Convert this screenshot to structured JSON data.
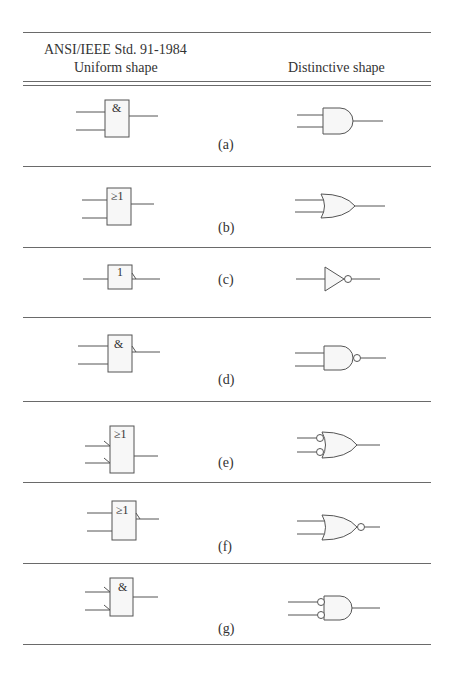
{
  "header": {
    "left_line1": "ANSI/IEEE Std. 91-1984",
    "left_line2": "Uniform shape",
    "right": "Distinctive shape"
  },
  "rows": [
    {
      "label": "(a)",
      "gate": "AND",
      "uniform_symbol": "&",
      "inputs": 2,
      "output_negated": false,
      "inputs_negated": false
    },
    {
      "label": "(b)",
      "gate": "OR",
      "uniform_symbol": "≥1",
      "inputs": 2,
      "output_negated": false,
      "inputs_negated": false
    },
    {
      "label": "(c)",
      "gate": "NOT",
      "uniform_symbol": "1",
      "inputs": 1,
      "output_negated": true,
      "inputs_negated": false
    },
    {
      "label": "(d)",
      "gate": "NAND",
      "uniform_symbol": "&",
      "inputs": 2,
      "output_negated": true,
      "inputs_negated": false
    },
    {
      "label": "(e)",
      "gate": "OR with negated inputs",
      "uniform_symbol": "≥1",
      "inputs": 2,
      "output_negated": false,
      "inputs_negated": true
    },
    {
      "label": "(f)",
      "gate": "NOR",
      "uniform_symbol": "≥1",
      "inputs": 2,
      "output_negated": true,
      "inputs_negated": false
    },
    {
      "label": "(g)",
      "gate": "AND with negated inputs",
      "uniform_symbol": "&",
      "inputs": 2,
      "output_negated": false,
      "inputs_negated": true
    }
  ],
  "colors": {
    "line": "#555555",
    "fill": "#f7f7f7",
    "text": "#333333"
  }
}
